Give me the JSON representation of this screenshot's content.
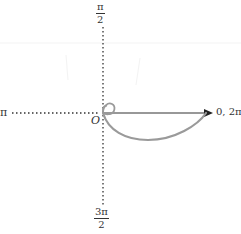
{
  "diagram": {
    "type": "polar-graph",
    "axis_labels": {
      "left": "π",
      "right": "0, 2π",
      "top": {
        "numerator": "π",
        "denominator": "2"
      },
      "bottom": {
        "numerator": "3π",
        "denominator": "2"
      },
      "origin": "O"
    },
    "curve": {
      "description": "polar curve with small inner loop at origin and large loop below polar axis",
      "color": "#9a9a9a"
    },
    "colors": {
      "axis": "#333333",
      "curve": "#9a9a9a",
      "background": "#ffffff"
    }
  }
}
